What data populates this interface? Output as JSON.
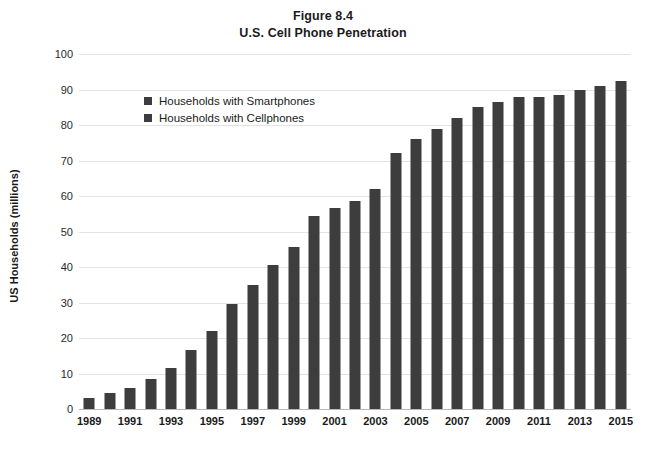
{
  "title": {
    "line1": "Figure 8.4",
    "line2": "U.S. Cell Phone Penetration"
  },
  "axes": {
    "ylabel": "US Households (millions)",
    "xlabel": "",
    "ytick_labels": [
      "0",
      "10",
      "20",
      "30",
      "40",
      "50",
      "60",
      "70",
      "80",
      "90",
      "100"
    ],
    "xtick_labels": [
      "1989",
      "1991",
      "1993",
      "1995",
      "1997",
      "1999",
      "2001",
      "2003",
      "2005",
      "2007",
      "2009",
      "2011",
      "2013",
      "2015"
    ]
  },
  "legend": {
    "position": "upper-left-inside",
    "items": [
      {
        "label": "Households with Smartphones",
        "color": "#3d3d3d",
        "marker": "square-swatch"
      },
      {
        "label": "Households with Cellphones",
        "color": "#3d3d3d",
        "marker": "square-swatch"
      }
    ]
  },
  "colors": {
    "bar": "#3d3d3d",
    "gridline": "#e3e3e3",
    "axis": "#b9b9b9",
    "text": "#1a1a1a",
    "background": "#ffffff"
  },
  "chart_data": {
    "type": "bar",
    "xlabel": "",
    "ylabel": "US Households (millions)",
    "ylim": [
      0,
      100
    ],
    "ytick_step": 10,
    "grid": true,
    "legend": [
      "Households with Smartphones",
      "Households with Cellphones"
    ],
    "categories": [
      "1989",
      "1990",
      "1991",
      "1992",
      "1993",
      "1994",
      "1995",
      "1996",
      "1997",
      "1998",
      "1999",
      "2000",
      "2001",
      "2002",
      "2003",
      "2004",
      "2005",
      "2006",
      "2007",
      "2008",
      "2009",
      "2010",
      "2011",
      "2012",
      "2013",
      "2014",
      "2015"
    ],
    "values": [
      3,
      4.5,
      6,
      8.5,
      11.5,
      16.5,
      22,
      29.5,
      35,
      40.5,
      45.5,
      54.5,
      56.5,
      58.5,
      62,
      72,
      76,
      79,
      82,
      85,
      86.5,
      88,
      88,
      88.5,
      90,
      91,
      92.5
    ],
    "series": [
      {
        "name": "Households with Cellphones",
        "values": [
          3,
          4.5,
          6,
          8.5,
          11.5,
          16.5,
          22,
          29.5,
          35,
          40.5,
          45.5,
          54.5,
          56.5,
          58.5,
          62,
          72,
          76,
          79,
          82,
          85,
          86.5,
          88,
          88,
          88.5,
          90,
          91,
          92.5
        ]
      }
    ]
  }
}
